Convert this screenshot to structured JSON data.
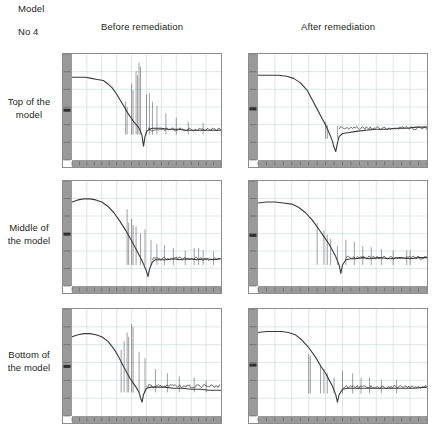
{
  "header": {
    "model_label": "Model",
    "model_number": "No 4"
  },
  "columns": [
    {
      "label": "Before remediation"
    },
    {
      "label": "After remediation"
    }
  ],
  "rows": [
    {
      "label_line1": "Top of the",
      "label_line2": "model"
    },
    {
      "label_line1": "Middle of",
      "label_line2": "the model"
    },
    {
      "label_line1": "Bottom of",
      "label_line2": "the model"
    }
  ],
  "style": {
    "trace_color": "#3a3a3a",
    "grid_color": "#b9c4cf",
    "axis_band_color": "#9a9a9a",
    "frame_color": "#8d8d8d",
    "text_color": "#231f20"
  },
  "chart_data": [
    {
      "id": "top-before",
      "type": "line",
      "title": "Top of the model — Before remediation",
      "xlabel": "",
      "ylabel": "",
      "grid": true,
      "legend": "none",
      "xlim": [
        0,
        100
      ],
      "ylim": [
        0,
        100
      ],
      "baseline": 78,
      "rolloff_start": 22,
      "rolloff_end": 47,
      "floor_level": 26,
      "notch_x": 48,
      "notch_depth": 10,
      "tail_level": 29,
      "series": [
        {
          "name": "response",
          "x": [
            0,
            4,
            9,
            13,
            17,
            21,
            24,
            27,
            30,
            33,
            36,
            38,
            40,
            42,
            44,
            45,
            46,
            47,
            48,
            49,
            50,
            52,
            54,
            57,
            60,
            64,
            68,
            72,
            76,
            80,
            85,
            90,
            95,
            100
          ],
          "y": [
            78,
            78,
            78,
            77,
            76,
            75,
            72,
            68,
            62,
            55,
            48,
            43,
            39,
            35,
            32,
            30,
            27,
            23,
            13,
            22,
            27,
            29,
            30,
            30,
            30,
            29,
            29,
            29,
            28,
            28,
            28,
            28,
            28,
            28
          ]
        }
      ],
      "spikes": [
        {
          "x": 36,
          "height": 55
        },
        {
          "x": 37,
          "height": 50
        },
        {
          "x": 40,
          "height": 72
        },
        {
          "x": 41,
          "height": 66
        },
        {
          "x": 43,
          "height": 84
        },
        {
          "x": 44,
          "height": 80
        },
        {
          "x": 45,
          "height": 92
        },
        {
          "x": 46,
          "height": 88
        },
        {
          "x": 50,
          "height": 62
        },
        {
          "x": 52,
          "height": 63
        },
        {
          "x": 54,
          "height": 55
        },
        {
          "x": 57,
          "height": 51
        },
        {
          "x": 63,
          "height": 44
        },
        {
          "x": 70,
          "height": 40
        },
        {
          "x": 78,
          "height": 36
        },
        {
          "x": 88,
          "height": 35
        }
      ]
    },
    {
      "id": "top-after",
      "type": "line",
      "title": "Top of the model — After remediation",
      "xlabel": "",
      "ylabel": "",
      "grid": true,
      "legend": "none",
      "xlim": [
        0,
        100
      ],
      "ylim": [
        0,
        100
      ],
      "baseline": 80,
      "rolloff_start": 20,
      "rolloff_end": 44,
      "floor_level": 22,
      "notch_x": 45,
      "notch_depth": 6,
      "tail_level": 30,
      "series": [
        {
          "name": "response",
          "x": [
            0,
            6,
            12,
            17,
            21,
            25,
            29,
            32,
            35,
            38,
            40,
            42,
            44,
            45,
            46,
            47,
            48,
            50,
            54,
            58,
            64,
            70,
            76,
            82,
            88,
            94,
            100
          ],
          "y": [
            80,
            80,
            80,
            79,
            77,
            73,
            66,
            57,
            48,
            39,
            33,
            26,
            18,
            12,
            8,
            16,
            22,
            25,
            26,
            27,
            28,
            29,
            29,
            30,
            30,
            31,
            31
          ]
        }
      ],
      "spikes": [
        {
          "x": 40,
          "height": 36
        },
        {
          "x": 41,
          "height": 33
        },
        {
          "x": 47,
          "height": 32
        }
      ]
    },
    {
      "id": "middle-before",
      "type": "line",
      "title": "Middle of the model — Before remediation",
      "xlabel": "",
      "ylabel": "",
      "grid": true,
      "legend": "none",
      "xlim": [
        0,
        100
      ],
      "ylim": [
        0,
        100
      ],
      "baseline": 82,
      "rolloff_start": 18,
      "rolloff_end": 50,
      "floor_level": 22,
      "notch_x": 51,
      "notch_depth": 8,
      "tail_level": 26,
      "series": [
        {
          "name": "response",
          "x": [
            0,
            4,
            8,
            12,
            16,
            20,
            24,
            28,
            32,
            36,
            40,
            43,
            46,
            48,
            50,
            51,
            52,
            54,
            56,
            60,
            64,
            68,
            72,
            78,
            84,
            90,
            95,
            100
          ],
          "y": [
            80,
            82,
            83,
            83,
            82,
            80,
            76,
            70,
            62,
            53,
            43,
            35,
            27,
            21,
            14,
            9,
            16,
            23,
            25,
            25,
            25,
            26,
            25,
            26,
            25,
            26,
            25,
            26
          ]
        }
      ],
      "spikes": [
        {
          "x": 37,
          "height": 73
        },
        {
          "x": 38,
          "height": 60
        },
        {
          "x": 40,
          "height": 64
        },
        {
          "x": 41,
          "height": 58
        },
        {
          "x": 43,
          "height": 57
        },
        {
          "x": 46,
          "height": 50
        },
        {
          "x": 49,
          "height": 54
        },
        {
          "x": 53,
          "height": 44
        },
        {
          "x": 57,
          "height": 40
        },
        {
          "x": 62,
          "height": 39
        },
        {
          "x": 68,
          "height": 36
        },
        {
          "x": 76,
          "height": 34
        },
        {
          "x": 82,
          "height": 36
        },
        {
          "x": 85,
          "height": 36
        },
        {
          "x": 88,
          "height": 34
        },
        {
          "x": 95,
          "height": 33
        }
      ]
    },
    {
      "id": "middle-after",
      "type": "line",
      "title": "Middle of the model — After remediation",
      "xlabel": "",
      "ylabel": "",
      "grid": true,
      "legend": "none",
      "xlim": [
        0,
        100
      ],
      "ylim": [
        0,
        100
      ],
      "baseline": 80,
      "rolloff_start": 22,
      "rolloff_end": 48,
      "floor_level": 22,
      "notch_x": 49,
      "notch_depth": 8,
      "tail_level": 27,
      "series": [
        {
          "name": "response",
          "x": [
            0,
            5,
            10,
            15,
            20,
            24,
            28,
            32,
            36,
            39,
            42,
            44,
            46,
            48,
            49,
            50,
            52,
            55,
            58,
            62,
            66,
            72,
            78,
            84,
            90,
            95,
            100
          ],
          "y": [
            79,
            80,
            80,
            79,
            78,
            75,
            70,
            63,
            54,
            47,
            40,
            34,
            28,
            20,
            12,
            20,
            25,
            26,
            26,
            27,
            26,
            27,
            26,
            27,
            26,
            27,
            27
          ]
        }
      ],
      "spikes": [
        {
          "x": 35,
          "height": 60
        },
        {
          "x": 39,
          "height": 53
        },
        {
          "x": 41,
          "height": 49
        },
        {
          "x": 43,
          "height": 45
        },
        {
          "x": 47,
          "height": 38
        },
        {
          "x": 52,
          "height": 44
        },
        {
          "x": 57,
          "height": 42
        },
        {
          "x": 62,
          "height": 38
        },
        {
          "x": 67,
          "height": 37
        },
        {
          "x": 73,
          "height": 35
        },
        {
          "x": 80,
          "height": 34
        },
        {
          "x": 88,
          "height": 34
        },
        {
          "x": 90,
          "height": 34
        }
      ]
    },
    {
      "id": "bottom-before",
      "type": "line",
      "title": "Bottom of the model — Before remediation",
      "xlabel": "",
      "ylabel": "",
      "grid": true,
      "legend": "none",
      "xlim": [
        0,
        100
      ],
      "ylim": [
        0,
        100
      ],
      "baseline": 77,
      "rolloff_start": 20,
      "rolloff_end": 46,
      "floor_level": 24,
      "notch_x": 47,
      "notch_depth": 9,
      "tail_level": 28,
      "series": [
        {
          "name": "response",
          "x": [
            0,
            4,
            8,
            12,
            16,
            20,
            24,
            28,
            31,
            34,
            37,
            39,
            41,
            43,
            45,
            46,
            47,
            48,
            50,
            53,
            57,
            62,
            68,
            74,
            80,
            86,
            92,
            100
          ],
          "y": [
            74,
            76,
            77,
            77,
            76,
            74,
            70,
            63,
            56,
            48,
            40,
            35,
            31,
            27,
            22,
            17,
            13,
            20,
            26,
            27,
            27,
            27,
            26,
            26,
            25,
            25,
            24,
            24
          ]
        }
      ],
      "spikes": [
        {
          "x": 33,
          "height": 62
        },
        {
          "x": 35,
          "height": 70
        },
        {
          "x": 37,
          "height": 78
        },
        {
          "x": 38,
          "height": 74
        },
        {
          "x": 40,
          "height": 86
        },
        {
          "x": 41,
          "height": 83
        },
        {
          "x": 45,
          "height": 60
        },
        {
          "x": 49,
          "height": 54
        },
        {
          "x": 56,
          "height": 44
        },
        {
          "x": 64,
          "height": 40
        },
        {
          "x": 72,
          "height": 37
        },
        {
          "x": 82,
          "height": 36
        },
        {
          "x": 90,
          "height": 33
        }
      ]
    },
    {
      "id": "bottom-after",
      "type": "line",
      "title": "Bottom of the model — After remediation",
      "xlabel": "",
      "ylabel": "",
      "grid": true,
      "legend": "none",
      "xlim": [
        0,
        100
      ],
      "ylim": [
        0,
        100
      ],
      "baseline": 79,
      "rolloff_start": 18,
      "rolloff_end": 46,
      "floor_level": 23,
      "notch_x": 47,
      "notch_depth": 8,
      "tail_level": 27,
      "series": [
        {
          "name": "response",
          "x": [
            0,
            5,
            10,
            14,
            18,
            22,
            26,
            30,
            34,
            37,
            40,
            42,
            44,
            46,
            47,
            48,
            50,
            53,
            57,
            62,
            68,
            74,
            80,
            86,
            92,
            100
          ],
          "y": [
            78,
            79,
            79,
            79,
            78,
            76,
            71,
            64,
            55,
            47,
            40,
            34,
            28,
            20,
            13,
            20,
            25,
            26,
            26,
            26,
            26,
            26,
            26,
            26,
            26,
            27
          ]
        }
      ],
      "spikes": [
        {
          "x": 30,
          "height": 58
        },
        {
          "x": 31,
          "height": 56
        },
        {
          "x": 37,
          "height": 48
        },
        {
          "x": 39,
          "height": 44
        },
        {
          "x": 41,
          "height": 40
        },
        {
          "x": 45,
          "height": 36
        },
        {
          "x": 50,
          "height": 42
        },
        {
          "x": 56,
          "height": 40
        },
        {
          "x": 61,
          "height": 36
        },
        {
          "x": 66,
          "height": 36
        },
        {
          "x": 73,
          "height": 34
        },
        {
          "x": 82,
          "height": 34
        }
      ]
    }
  ]
}
